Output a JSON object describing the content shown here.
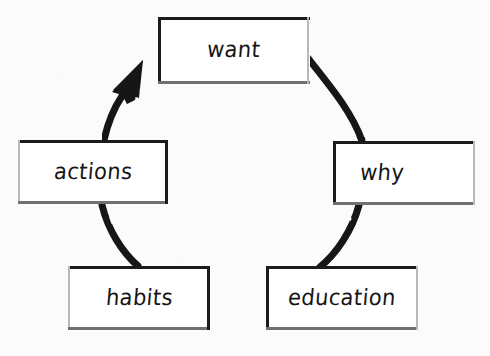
{
  "diagram": {
    "type": "cycle",
    "title": "",
    "direction": "counterclockwise",
    "background_color": "#fbfbfc",
    "ink_color": "#1b1b1b",
    "style": "hand-drawn",
    "nodes": [
      {
        "id": "want",
        "label": "want",
        "position": "top"
      },
      {
        "id": "why",
        "label": "why",
        "position": "right"
      },
      {
        "id": "education",
        "label": "education",
        "position": "bottom-right"
      },
      {
        "id": "habits",
        "label": "habits",
        "position": "bottom-left"
      },
      {
        "id": "actions",
        "label": "actions",
        "position": "left"
      }
    ],
    "connectors": [
      {
        "id": "want-to-why",
        "from": "want",
        "to": "why",
        "shape": "arc",
        "arrowhead": false
      },
      {
        "id": "why-to-education",
        "from": "why",
        "to": "education",
        "shape": "arc",
        "arrowhead": false
      },
      {
        "id": "education-to-habits",
        "from": "education",
        "to": "habits",
        "shape": "line",
        "arrowhead": false
      },
      {
        "id": "habits-to-actions",
        "from": "habits",
        "to": "actions",
        "shape": "arc",
        "arrowhead": false
      },
      {
        "id": "actions-to-want",
        "from": "actions",
        "to": "want",
        "shape": "arc",
        "arrowhead": true
      }
    ]
  }
}
